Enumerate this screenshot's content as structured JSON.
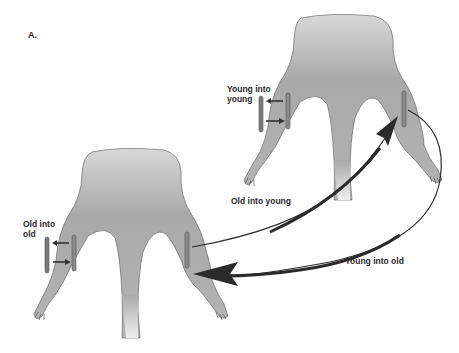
{
  "figure": {
    "panel_label": "A."
  },
  "animals": [
    {
      "id": "young-mouse",
      "position": "upper-right",
      "graft_label": "Young into\nyoung",
      "color_body": "#a8a8a8"
    },
    {
      "id": "old-mouse",
      "position": "lower-left",
      "graft_label": "Old into\nold",
      "color_body": "#a8a8a8"
    }
  ],
  "arrows": [
    {
      "label": "Old into young",
      "from": "old-mouse-right-leg",
      "to": "young-mouse-right-leg"
    },
    {
      "label": "Young into old",
      "from": "young-mouse-right-leg",
      "to": "old-mouse-right-leg"
    }
  ],
  "colors": {
    "muscle_graft": "#7a7a7a",
    "arrow": "#2b2b2b",
    "outline": "#4a4a4a"
  }
}
